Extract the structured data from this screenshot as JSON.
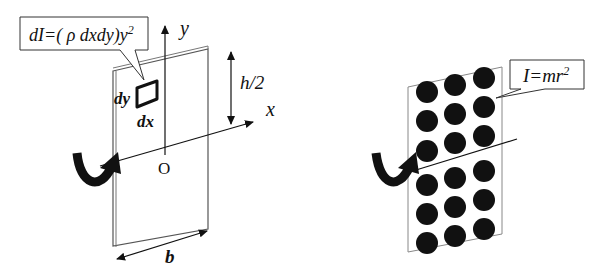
{
  "left_panel": {
    "callout_formula": "dI=( ρ dxdy)y",
    "callout_exponent": "2",
    "axis_y_label": "y",
    "axis_x_label": "x",
    "origin_label": "O",
    "half_height_label": "h/2",
    "element_dy_label": "dy",
    "element_dx_label": "dx",
    "width_label": "b",
    "rotation_arrow": "curved-rotation-arrow"
  },
  "right_panel": {
    "callout_formula": "I=mr",
    "callout_exponent": "2",
    "particle_grid": {
      "rows": 6,
      "cols": 3
    },
    "rotation_arrow": "curved-rotation-arrow"
  },
  "colors": {
    "ink": "#111111",
    "plate_edge": "#555555",
    "background": "#ffffff"
  }
}
